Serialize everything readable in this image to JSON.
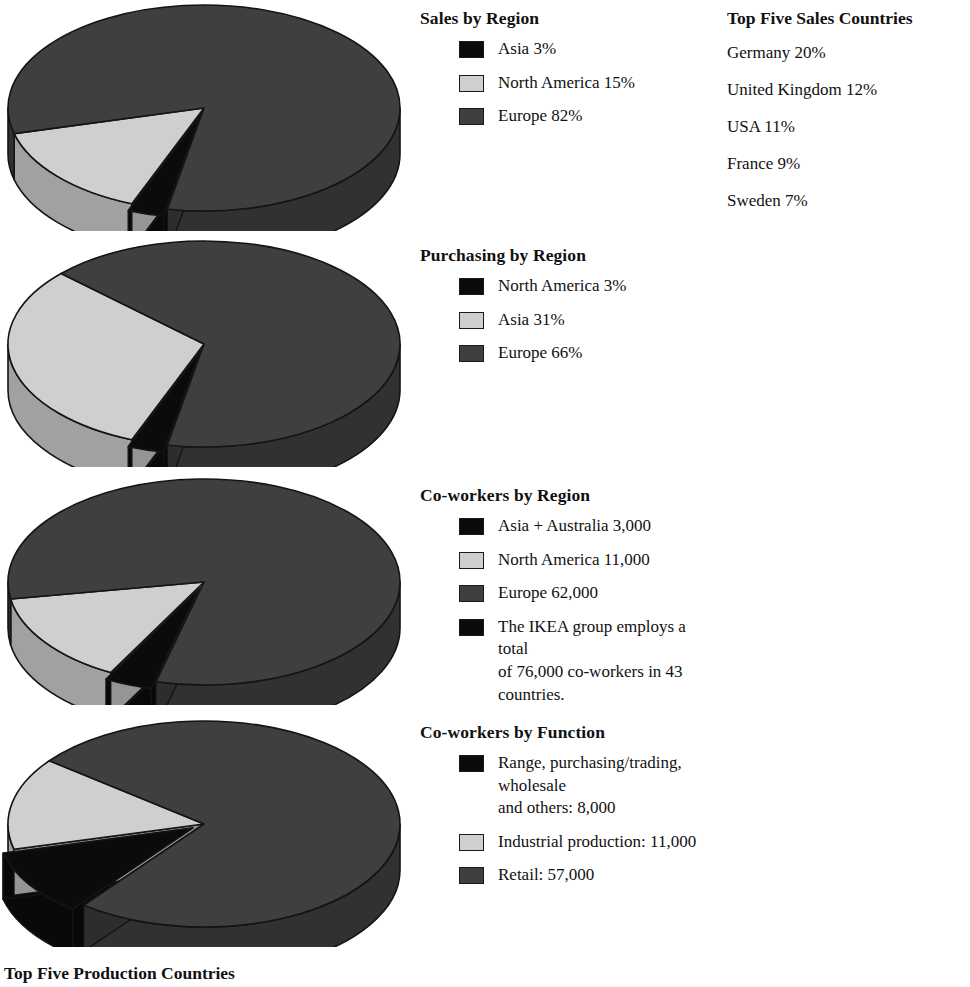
{
  "page": {
    "bottom_caption": "Top Five Production Countries"
  },
  "colors": {
    "black": "#0b0b0b",
    "light_gray": "#cfcfcf",
    "dark_gray": "#3f3f3f",
    "outline": "#1a1a1a",
    "background": "#ffffff"
  },
  "side_panel": {
    "heading": "Top Five Sales Countries",
    "items": [
      "Germany 20%",
      "United Kingdom 12%",
      "USA 11%",
      "France 9%",
      "Sweden 7%"
    ]
  },
  "sections": [
    {
      "heading": "Sales by Region",
      "legend": [
        {
          "swatch": "black",
          "label": "Asia 3%"
        },
        {
          "swatch": "light",
          "label": "North America 15%"
        },
        {
          "swatch": "dark",
          "label": "Europe 82%"
        }
      ]
    },
    {
      "heading": "Purchasing by Region",
      "legend": [
        {
          "swatch": "black",
          "label": "North America 3%"
        },
        {
          "swatch": "light",
          "label": "Asia 31%"
        },
        {
          "swatch": "dark",
          "label": "Europe 66%"
        }
      ]
    },
    {
      "heading": "Co-workers by Region",
      "legend": [
        {
          "swatch": "black",
          "label": "Asia + Australia 3,000"
        },
        {
          "swatch": "light",
          "label": "North America 11,000"
        },
        {
          "swatch": "dark",
          "label": "Europe 62,000"
        },
        {
          "swatch": "black",
          "label": "The IKEA group employs a total\nof 76,000 co-workers in 43 countries."
        }
      ]
    },
    {
      "heading": "Co-workers by Function",
      "legend": [
        {
          "swatch": "black",
          "label": "Range, purchasing/trading, wholesale\nand others: 8,000"
        },
        {
          "swatch": "light",
          "label": "Industrial production: 11,000"
        },
        {
          "swatch": "dark",
          "label": "Retail: 57,000"
        }
      ]
    }
  ],
  "chart_data": [
    {
      "type": "pie",
      "title": "Sales by Region",
      "categories": [
        "Asia",
        "North America",
        "Europe"
      ],
      "values": [
        3,
        15,
        82
      ],
      "unit": "percent",
      "colors": [
        "#0b0b0b",
        "#cfcfcf",
        "#3f3f3f"
      ],
      "exploded_slice": "Asia",
      "three_d": true,
      "legend_position": "right"
    },
    {
      "type": "pie",
      "title": "Purchasing by Region",
      "categories": [
        "North America",
        "Asia",
        "Europe"
      ],
      "values": [
        3,
        31,
        66
      ],
      "unit": "percent",
      "colors": [
        "#0b0b0b",
        "#cfcfcf",
        "#3f3f3f"
      ],
      "exploded_slice": "North America",
      "three_d": true,
      "legend_position": "right"
    },
    {
      "type": "pie",
      "title": "Co-workers by Region",
      "categories": [
        "Asia + Australia",
        "North America",
        "Europe"
      ],
      "values": [
        3000,
        11000,
        62000
      ],
      "unit": "co-workers",
      "total": 76000,
      "colors": [
        "#0b0b0b",
        "#cfcfcf",
        "#3f3f3f"
      ],
      "exploded_slice": "Asia + Australia",
      "three_d": true,
      "legend_position": "right",
      "note": "The IKEA group employs a total of 76,000 co-workers in 43 countries."
    },
    {
      "type": "pie",
      "title": "Co-workers by Function",
      "categories": [
        "Range, purchasing/trading, wholesale and others",
        "Industrial production",
        "Retail"
      ],
      "values": [
        8000,
        11000,
        57000
      ],
      "unit": "co-workers",
      "total": 76000,
      "colors": [
        "#0b0b0b",
        "#cfcfcf",
        "#3f3f3f"
      ],
      "exploded_slice": "Range, purchasing/trading, wholesale and others",
      "three_d": true,
      "legend_position": "right"
    }
  ]
}
